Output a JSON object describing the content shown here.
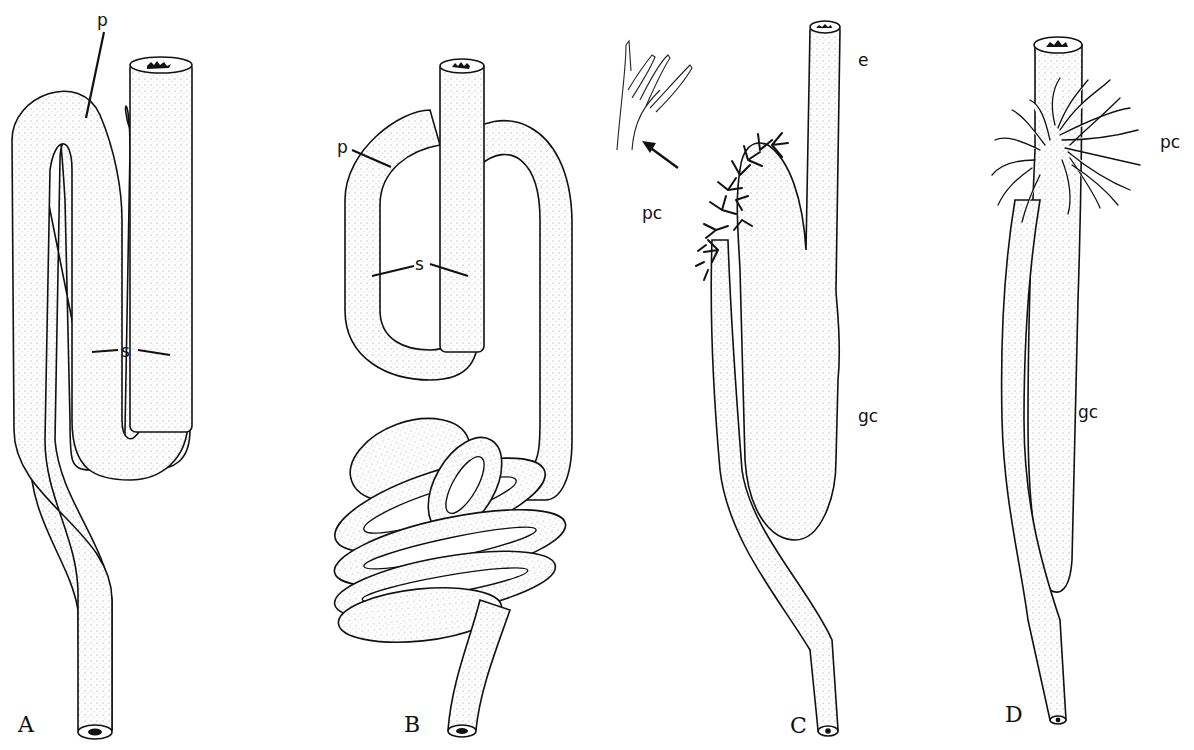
{
  "figure": {
    "type": "scientific line illustration",
    "style": "stippled ink drawing",
    "panels": [
      {
        "id": "A",
        "label": "A",
        "annotations": [
          {
            "key": "p",
            "text": "p"
          },
          {
            "key": "s",
            "text": "s"
          }
        ]
      },
      {
        "id": "B",
        "label": "B",
        "annotations": [
          {
            "key": "p",
            "text": "p"
          },
          {
            "key": "s",
            "text": "s"
          }
        ]
      },
      {
        "id": "C",
        "label": "C",
        "annotations": [
          {
            "key": "pc",
            "text": "pc"
          },
          {
            "key": "e",
            "text": "e"
          },
          {
            "key": "gc",
            "text": "gc"
          }
        ],
        "inset": "enlarged branched tip with arrow"
      },
      {
        "id": "D",
        "label": "D",
        "annotations": [
          {
            "key": "pc",
            "text": "pc"
          },
          {
            "key": "gc",
            "text": "gc"
          }
        ]
      }
    ]
  },
  "labels": {
    "A": {
      "panel": "A",
      "p": "p",
      "s": "s"
    },
    "B": {
      "panel": "B",
      "p": "p",
      "s": "s"
    },
    "C": {
      "panel": "C",
      "pc": "pc",
      "e": "e",
      "gc": "gc"
    },
    "D": {
      "panel": "D",
      "pc": "pc",
      "gc": "gc"
    }
  },
  "colors": {
    "ink": "#111111",
    "paper": "#ffffff",
    "stipple": "#8a8a8a"
  }
}
